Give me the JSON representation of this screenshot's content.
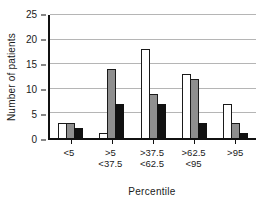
{
  "chart_data": {
    "type": "bar",
    "title": "",
    "xlabel": "Percentile",
    "ylabel": "Number of patients",
    "ylim": [
      0,
      25
    ],
    "yticks": [
      0,
      5,
      10,
      15,
      20,
      25
    ],
    "grid": true,
    "legend": "none",
    "categories": [
      "<5",
      ">5 <37.5",
      ">37.5 <62.5",
      ">62.5 <95",
      ">95"
    ],
    "category_lines": [
      [
        "<5"
      ],
      [
        ">5",
        "<37.5"
      ],
      [
        ">37.5",
        "<62.5"
      ],
      [
        ">62.5",
        "<95"
      ],
      [
        ">95"
      ]
    ],
    "series": [
      {
        "name": "white",
        "color": "#ffffff",
        "border_color": "#1a1a1a",
        "values": [
          3,
          1,
          18,
          13,
          7
        ]
      },
      {
        "name": "grey",
        "color": "#8f8f8f",
        "border_color": "#1a1a1a",
        "values": [
          3,
          14,
          9,
          12,
          3
        ]
      },
      {
        "name": "black",
        "color": "#111111",
        "border_color": "#111111",
        "values": [
          2,
          7,
          7,
          3,
          1
        ]
      }
    ],
    "colors": {
      "axis": "#111111",
      "gridline": "#b5b5b5",
      "text": "#1a1a1a",
      "background": "#ffffff"
    }
  }
}
